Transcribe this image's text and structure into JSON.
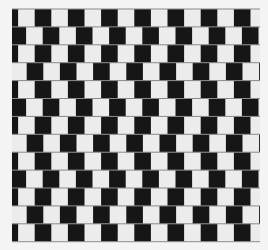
{
  "illusion": {
    "name": "Café wall illusion",
    "colors": {
      "background": "#f4f4f4",
      "dark_tile": "#161616",
      "light_tile": "#ececec",
      "mortar": "#8a8a8a"
    },
    "grid": {
      "left": 12,
      "top": 9,
      "right": 260,
      "row_count": 13,
      "row_height": 17.9,
      "tile_width": 16.6,
      "mortar_width": 1,
      "row_offsets": [
        0,
        8,
        0,
        -8,
        0,
        8,
        0,
        -8,
        0,
        8,
        0,
        -8,
        0
      ],
      "row_phase_start": -10.5
    }
  }
}
